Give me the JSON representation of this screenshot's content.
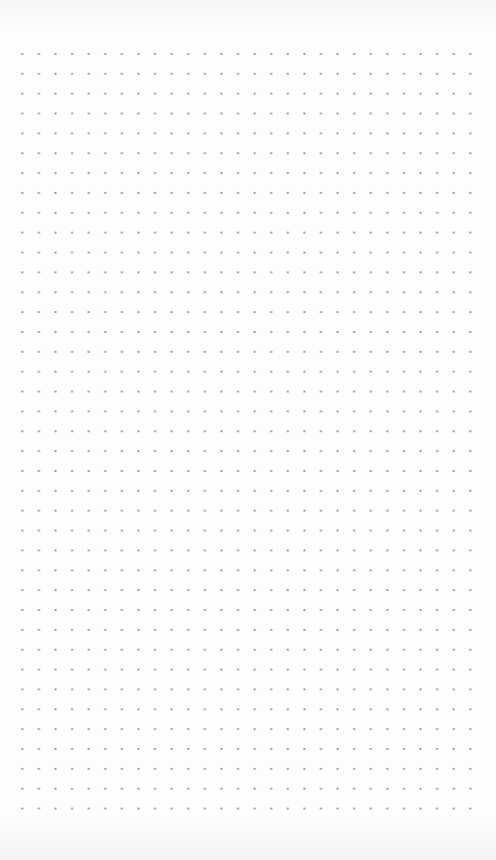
{
  "paper": {
    "type": "dot-grid",
    "columns": 28,
    "rows": 39,
    "dot_color": "#9a9a9a",
    "background_color": "#fdfdfd"
  }
}
